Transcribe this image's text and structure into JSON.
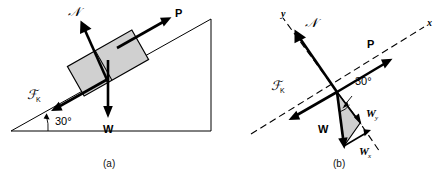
{
  "figure": {
    "background_color": "#ffffff",
    "line_color": "#000000",
    "block_fill_color": "#d0d0d0",
    "triangle_fill_color": "#cfcfcf"
  },
  "panel_a": {
    "caption": "(a)",
    "angle_label": "30°",
    "labels": {
      "normal": "ℱ",
      "normal_symbol": "𝒩",
      "normal_text": "N",
      "applied": "P",
      "friction_symbol": "ℱ",
      "friction_sub": "K",
      "weight": "W"
    },
    "vectors": [
      {
        "name": "normal-force",
        "label": "N",
        "direction": "up-left perpendicular to incline"
      },
      {
        "name": "applied-force",
        "label": "P",
        "direction": "up the incline"
      },
      {
        "name": "friction-force",
        "label": "F K",
        "direction": "down the incline"
      },
      {
        "name": "weight-force",
        "label": "W",
        "direction": "straight down"
      }
    ]
  },
  "panel_b": {
    "caption": "(b)",
    "angle_label": "30°",
    "axis_x": "x",
    "axis_y": "y",
    "labels": {
      "normal_symbol": "𝒩",
      "normal_text": "N",
      "applied": "P",
      "friction_symbol": "ℱ",
      "friction_sub": "K",
      "weight": "W",
      "weight_x": "W",
      "weight_x_sub": "x",
      "weight_y": "W",
      "weight_y_sub": "y"
    },
    "vectors": [
      {
        "name": "normal-force",
        "label": "N",
        "direction": "along +y"
      },
      {
        "name": "applied-force",
        "label": "P",
        "direction": "along +x"
      },
      {
        "name": "friction-force",
        "label": "F K",
        "direction": "along -x"
      },
      {
        "name": "weight-force",
        "label": "W",
        "direction": "straight down"
      },
      {
        "name": "weight-x-component",
        "label": "Wx",
        "direction": "along -x projection"
      },
      {
        "name": "weight-y-component",
        "label": "Wy",
        "direction": "along -y projection"
      }
    ]
  }
}
